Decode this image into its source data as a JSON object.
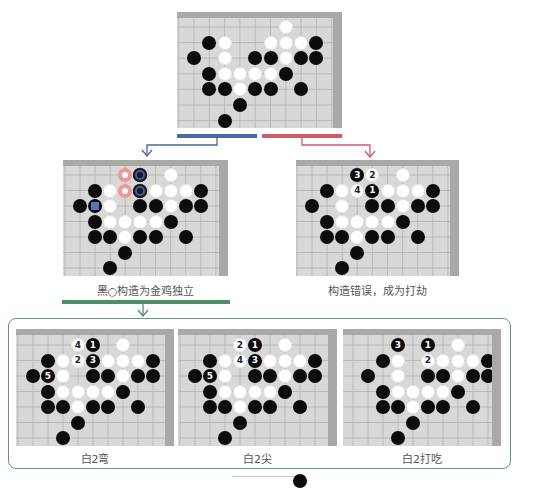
{
  "colors": {
    "blue_bar": "#4a67a8",
    "red_bar": "#d35a66",
    "green_bar": "#4f8e66",
    "frame": "#5c9a76",
    "board_bg": "#d8d8d6",
    "board_edge": "#a9a9a7",
    "marker_red": "#e99999",
    "marker_blue": "#4b5f95"
  },
  "top_board": {
    "stones": [
      {
        "r": 0,
        "c": 6,
        "color": "w"
      },
      {
        "r": 1,
        "c": 1,
        "color": "b"
      },
      {
        "r": 1,
        "c": 2,
        "color": "w"
      },
      {
        "r": 1,
        "c": 5,
        "color": "w"
      },
      {
        "r": 1,
        "c": 6,
        "color": "w"
      },
      {
        "r": 1,
        "c": 7,
        "color": "w"
      },
      {
        "r": 1,
        "c": 8,
        "color": "b"
      },
      {
        "r": 2,
        "c": 0,
        "color": "b"
      },
      {
        "r": 2,
        "c": 2,
        "color": "w"
      },
      {
        "r": 2,
        "c": 4,
        "color": "b"
      },
      {
        "r": 2,
        "c": 5,
        "color": "b"
      },
      {
        "r": 2,
        "c": 6,
        "color": "w"
      },
      {
        "r": 2,
        "c": 7,
        "color": "b"
      },
      {
        "r": 2,
        "c": 8,
        "color": "b"
      },
      {
        "r": 3,
        "c": 1,
        "color": "b"
      },
      {
        "r": 3,
        "c": 2,
        "color": "w"
      },
      {
        "r": 3,
        "c": 3,
        "color": "w"
      },
      {
        "r": 3,
        "c": 4,
        "color": "w"
      },
      {
        "r": 3,
        "c": 5,
        "color": "w"
      },
      {
        "r": 3,
        "c": 6,
        "color": "b"
      },
      {
        "r": 4,
        "c": 1,
        "color": "b"
      },
      {
        "r": 4,
        "c": 2,
        "color": "b"
      },
      {
        "r": 4,
        "c": 3,
        "color": "w"
      },
      {
        "r": 4,
        "c": 4,
        "color": "b"
      },
      {
        "r": 4,
        "c": 5,
        "color": "b"
      },
      {
        "r": 4,
        "c": 7,
        "color": "b"
      },
      {
        "r": 5,
        "c": 3,
        "color": "b"
      },
      {
        "r": 6,
        "c": 2,
        "color": "b"
      }
    ]
  },
  "left_variation": {
    "caption": "黑○构造为金鸡独立",
    "stones": [
      {
        "r": 0,
        "c": 3,
        "color": "ring-red"
      },
      {
        "r": 0,
        "c": 4,
        "color": "b",
        "marker": "ring-blue"
      },
      {
        "r": 0,
        "c": 6,
        "color": "w"
      },
      {
        "r": 1,
        "c": 1,
        "color": "b"
      },
      {
        "r": 1,
        "c": 2,
        "color": "w"
      },
      {
        "r": 1,
        "c": 3,
        "color": "ring-red"
      },
      {
        "r": 1,
        "c": 4,
        "color": "b",
        "marker": "ring-blue"
      },
      {
        "r": 1,
        "c": 5,
        "color": "w"
      },
      {
        "r": 1,
        "c": 6,
        "color": "w"
      },
      {
        "r": 1,
        "c": 7,
        "color": "w"
      },
      {
        "r": 1,
        "c": 8,
        "color": "b"
      },
      {
        "r": 2,
        "c": 0,
        "color": "b"
      },
      {
        "r": 2,
        "c": 1,
        "color": "b",
        "marker": "sq-blue"
      },
      {
        "r": 2,
        "c": 2,
        "color": "w"
      },
      {
        "r": 2,
        "c": 4,
        "color": "b"
      },
      {
        "r": 2,
        "c": 5,
        "color": "b"
      },
      {
        "r": 2,
        "c": 6,
        "color": "w"
      },
      {
        "r": 2,
        "c": 7,
        "color": "b"
      },
      {
        "r": 2,
        "c": 8,
        "color": "b"
      },
      {
        "r": 3,
        "c": 1,
        "color": "b"
      },
      {
        "r": 3,
        "c": 2,
        "color": "w"
      },
      {
        "r": 3,
        "c": 3,
        "color": "w"
      },
      {
        "r": 3,
        "c": 4,
        "color": "w"
      },
      {
        "r": 3,
        "c": 5,
        "color": "w"
      },
      {
        "r": 3,
        "c": 6,
        "color": "b"
      },
      {
        "r": 4,
        "c": 1,
        "color": "b"
      },
      {
        "r": 4,
        "c": 2,
        "color": "b"
      },
      {
        "r": 4,
        "c": 3,
        "color": "w"
      },
      {
        "r": 4,
        "c": 4,
        "color": "b"
      },
      {
        "r": 4,
        "c": 5,
        "color": "b"
      },
      {
        "r": 4,
        "c": 7,
        "color": "b"
      },
      {
        "r": 5,
        "c": 3,
        "color": "b"
      },
      {
        "r": 6,
        "c": 2,
        "color": "b"
      }
    ]
  },
  "right_variation": {
    "caption": "构造错误，成为打劫",
    "stones": [
      {
        "r": 0,
        "c": 3,
        "color": "b",
        "label": "3"
      },
      {
        "r": 0,
        "c": 4,
        "color": "w",
        "label": "2"
      },
      {
        "r": 0,
        "c": 6,
        "color": "w"
      },
      {
        "r": 1,
        "c": 1,
        "color": "b"
      },
      {
        "r": 1,
        "c": 2,
        "color": "w"
      },
      {
        "r": 1,
        "c": 3,
        "color": "w",
        "label": "4"
      },
      {
        "r": 1,
        "c": 4,
        "color": "b",
        "label": "1"
      },
      {
        "r": 1,
        "c": 5,
        "color": "w"
      },
      {
        "r": 1,
        "c": 6,
        "color": "w"
      },
      {
        "r": 1,
        "c": 7,
        "color": "w"
      },
      {
        "r": 1,
        "c": 8,
        "color": "b"
      },
      {
        "r": 2,
        "c": 0,
        "color": "b"
      },
      {
        "r": 2,
        "c": 2,
        "color": "w"
      },
      {
        "r": 2,
        "c": 4,
        "color": "b"
      },
      {
        "r": 2,
        "c": 5,
        "color": "b"
      },
      {
        "r": 2,
        "c": 6,
        "color": "w"
      },
      {
        "r": 2,
        "c": 7,
        "color": "b"
      },
      {
        "r": 2,
        "c": 8,
        "color": "b"
      },
      {
        "r": 3,
        "c": 1,
        "color": "b"
      },
      {
        "r": 3,
        "c": 2,
        "color": "w"
      },
      {
        "r": 3,
        "c": 3,
        "color": "w"
      },
      {
        "r": 3,
        "c": 4,
        "color": "w"
      },
      {
        "r": 3,
        "c": 5,
        "color": "w"
      },
      {
        "r": 3,
        "c": 6,
        "color": "b"
      },
      {
        "r": 4,
        "c": 1,
        "color": "b"
      },
      {
        "r": 4,
        "c": 2,
        "color": "b"
      },
      {
        "r": 4,
        "c": 3,
        "color": "w"
      },
      {
        "r": 4,
        "c": 4,
        "color": "b"
      },
      {
        "r": 4,
        "c": 5,
        "color": "b"
      },
      {
        "r": 4,
        "c": 7,
        "color": "b"
      },
      {
        "r": 5,
        "c": 3,
        "color": "b"
      },
      {
        "r": 6,
        "c": 2,
        "color": "b"
      }
    ]
  },
  "sub_variations": [
    {
      "caption": "白2弯",
      "stones": [
        {
          "r": 0,
          "c": 3,
          "color": "w",
          "label": "4"
        },
        {
          "r": 0,
          "c": 4,
          "color": "b",
          "label": "1"
        },
        {
          "r": 0,
          "c": 6,
          "color": "w"
        },
        {
          "r": 1,
          "c": 1,
          "color": "b"
        },
        {
          "r": 1,
          "c": 2,
          "color": "w"
        },
        {
          "r": 1,
          "c": 3,
          "color": "w",
          "label": "2"
        },
        {
          "r": 1,
          "c": 4,
          "color": "b",
          "label": "3"
        },
        {
          "r": 1,
          "c": 5,
          "color": "w"
        },
        {
          "r": 1,
          "c": 6,
          "color": "w"
        },
        {
          "r": 1,
          "c": 7,
          "color": "w"
        },
        {
          "r": 1,
          "c": 8,
          "color": "b"
        },
        {
          "r": 2,
          "c": 0,
          "color": "b"
        },
        {
          "r": 2,
          "c": 1,
          "color": "b",
          "label": "5"
        },
        {
          "r": 2,
          "c": 2,
          "color": "w"
        },
        {
          "r": 2,
          "c": 4,
          "color": "b"
        },
        {
          "r": 2,
          "c": 5,
          "color": "b"
        },
        {
          "r": 2,
          "c": 6,
          "color": "w"
        },
        {
          "r": 2,
          "c": 7,
          "color": "b"
        },
        {
          "r": 2,
          "c": 8,
          "color": "b"
        },
        {
          "r": 3,
          "c": 1,
          "color": "b"
        },
        {
          "r": 3,
          "c": 2,
          "color": "w"
        },
        {
          "r": 3,
          "c": 3,
          "color": "w"
        },
        {
          "r": 3,
          "c": 4,
          "color": "w"
        },
        {
          "r": 3,
          "c": 5,
          "color": "w"
        },
        {
          "r": 3,
          "c": 6,
          "color": "b"
        },
        {
          "r": 4,
          "c": 1,
          "color": "b"
        },
        {
          "r": 4,
          "c": 2,
          "color": "b"
        },
        {
          "r": 4,
          "c": 3,
          "color": "w"
        },
        {
          "r": 4,
          "c": 4,
          "color": "b"
        },
        {
          "r": 4,
          "c": 5,
          "color": "b"
        },
        {
          "r": 4,
          "c": 7,
          "color": "b"
        },
        {
          "r": 5,
          "c": 3,
          "color": "b"
        },
        {
          "r": 6,
          "c": 2,
          "color": "b"
        }
      ]
    },
    {
      "caption": "白2尖",
      "stones": [
        {
          "r": 0,
          "c": 3,
          "color": "w",
          "label": "2"
        },
        {
          "r": 0,
          "c": 4,
          "color": "b",
          "label": "1"
        },
        {
          "r": 0,
          "c": 6,
          "color": "w"
        },
        {
          "r": 1,
          "c": 1,
          "color": "b"
        },
        {
          "r": 1,
          "c": 2,
          "color": "w"
        },
        {
          "r": 1,
          "c": 3,
          "color": "w",
          "label": "4"
        },
        {
          "r": 1,
          "c": 4,
          "color": "b",
          "label": "3"
        },
        {
          "r": 1,
          "c": 5,
          "color": "w"
        },
        {
          "r": 1,
          "c": 6,
          "color": "w"
        },
        {
          "r": 1,
          "c": 7,
          "color": "w"
        },
        {
          "r": 1,
          "c": 8,
          "color": "b"
        },
        {
          "r": 2,
          "c": 0,
          "color": "b"
        },
        {
          "r": 2,
          "c": 1,
          "color": "b",
          "label": "5"
        },
        {
          "r": 2,
          "c": 2,
          "color": "w"
        },
        {
          "r": 2,
          "c": 4,
          "color": "b"
        },
        {
          "r": 2,
          "c": 5,
          "color": "b"
        },
        {
          "r": 2,
          "c": 6,
          "color": "w"
        },
        {
          "r": 2,
          "c": 7,
          "color": "b"
        },
        {
          "r": 2,
          "c": 8,
          "color": "b"
        },
        {
          "r": 3,
          "c": 1,
          "color": "b"
        },
        {
          "r": 3,
          "c": 2,
          "color": "w"
        },
        {
          "r": 3,
          "c": 3,
          "color": "w"
        },
        {
          "r": 3,
          "c": 4,
          "color": "w"
        },
        {
          "r": 3,
          "c": 5,
          "color": "w"
        },
        {
          "r": 3,
          "c": 6,
          "color": "b"
        },
        {
          "r": 4,
          "c": 1,
          "color": "b"
        },
        {
          "r": 4,
          "c": 2,
          "color": "b"
        },
        {
          "r": 4,
          "c": 3,
          "color": "w"
        },
        {
          "r": 4,
          "c": 4,
          "color": "b"
        },
        {
          "r": 4,
          "c": 5,
          "color": "b"
        },
        {
          "r": 4,
          "c": 7,
          "color": "b"
        },
        {
          "r": 5,
          "c": 3,
          "color": "b"
        },
        {
          "r": 6,
          "c": 2,
          "color": "b"
        }
      ]
    },
    {
      "caption": "白2打吃",
      "stones": [
        {
          "r": 0,
          "c": 2,
          "color": "b",
          "label": "3"
        },
        {
          "r": 0,
          "c": 4,
          "color": "b",
          "label": "1"
        },
        {
          "r": 0,
          "c": 6,
          "color": "w"
        },
        {
          "r": 1,
          "c": 1,
          "color": "b"
        },
        {
          "r": 1,
          "c": 2,
          "color": "w"
        },
        {
          "r": 1,
          "c": 4,
          "color": "w",
          "label": "2"
        },
        {
          "r": 1,
          "c": 5,
          "color": "w"
        },
        {
          "r": 1,
          "c": 6,
          "color": "w"
        },
        {
          "r": 1,
          "c": 7,
          "color": "w"
        },
        {
          "r": 1,
          "c": 8,
          "color": "b"
        },
        {
          "r": 2,
          "c": 0,
          "color": "b"
        },
        {
          "r": 2,
          "c": 2,
          "color": "w"
        },
        {
          "r": 2,
          "c": 4,
          "color": "b"
        },
        {
          "r": 2,
          "c": 5,
          "color": "b"
        },
        {
          "r": 2,
          "c": 6,
          "color": "w"
        },
        {
          "r": 2,
          "c": 7,
          "color": "b"
        },
        {
          "r": 2,
          "c": 8,
          "color": "b"
        },
        {
          "r": 3,
          "c": 1,
          "color": "b"
        },
        {
          "r": 3,
          "c": 2,
          "color": "w"
        },
        {
          "r": 3,
          "c": 3,
          "color": "w"
        },
        {
          "r": 3,
          "c": 4,
          "color": "w"
        },
        {
          "r": 3,
          "c": 5,
          "color": "w"
        },
        {
          "r": 3,
          "c": 6,
          "color": "b"
        },
        {
          "r": 4,
          "c": 1,
          "color": "b"
        },
        {
          "r": 4,
          "c": 2,
          "color": "b"
        },
        {
          "r": 4,
          "c": 3,
          "color": "w"
        },
        {
          "r": 4,
          "c": 4,
          "color": "b"
        },
        {
          "r": 4,
          "c": 5,
          "color": "b"
        },
        {
          "r": 4,
          "c": 7,
          "color": "b"
        },
        {
          "r": 5,
          "c": 3,
          "color": "b"
        },
        {
          "r": 6,
          "c": 2,
          "color": "b"
        }
      ]
    }
  ]
}
